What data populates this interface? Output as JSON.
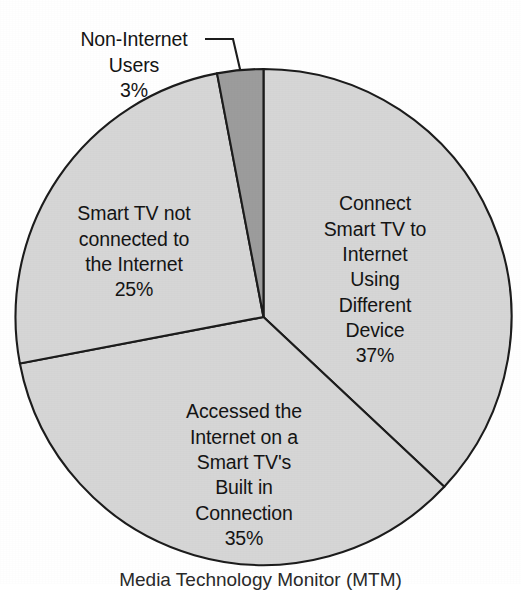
{
  "chart_data": {
    "type": "pie",
    "title": "",
    "subtitle": "",
    "legend_position": "none",
    "labels_inside": true,
    "units": "percent",
    "total": 100,
    "categories": [
      "Connect Smart TV to Internet Using Different Device",
      "Accessed the Internet on a Smart TV's Built in Connection",
      "Smart TV not connected to the Internet",
      "Non-Internet Users"
    ],
    "values": [
      37,
      35,
      25,
      3
    ],
    "series": [
      {
        "name": "Share of respondents",
        "values": [
          37,
          35,
          25,
          3
        ]
      }
    ],
    "slices": [
      {
        "label": "Connect Smart TV to Internet Using Different Device",
        "label_lines": "Connect\nSmart TV to\nInternet\nUsing\nDifferent\nDevice",
        "value": 37,
        "value_text": "37%",
        "color": "#d6d6d6",
        "start_angle_deg": 0,
        "end_angle_deg": 133.2
      },
      {
        "label": "Accessed the Internet on a Smart TV's Built in Connection",
        "label_lines": "Accessed the\nInternet on a\nSmart TV's\nBuilt in\nConnection",
        "value": 35,
        "value_text": "35%",
        "color": "#d6d6d6",
        "start_angle_deg": 133.2,
        "end_angle_deg": 259.2
      },
      {
        "label": "Smart TV not connected to the Internet",
        "label_lines": "Smart TV not\nconnected to\nthe Internet",
        "value": 25,
        "value_text": "25%",
        "color": "#d6d6d6",
        "start_angle_deg": 259.2,
        "end_angle_deg": 349.2
      },
      {
        "label": "Non-Internet Users",
        "label_lines": "Non-Internet\nUsers",
        "value": 3,
        "value_text": "3%",
        "color": "#9c9c9c",
        "start_angle_deg": 349.2,
        "end_angle_deg": 360
      }
    ],
    "colors": {
      "slice_light": "#d6d6d6",
      "slice_dark": "#9c9c9c",
      "outline": "#1c1c1c",
      "background": "#ffffff",
      "text": "#141414"
    }
  },
  "source_caption": "Media Technology Monitor (MTM)"
}
